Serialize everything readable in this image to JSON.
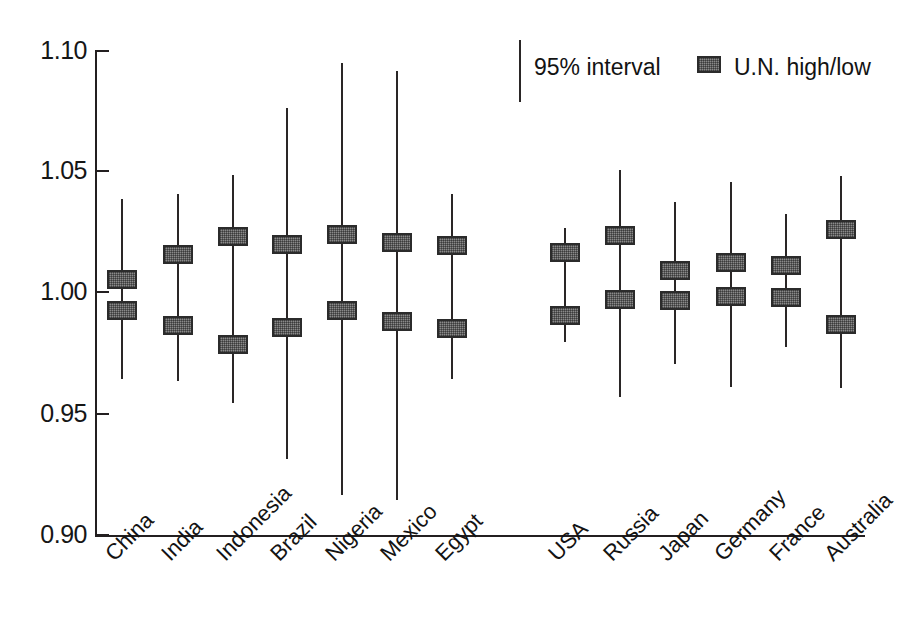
{
  "chart_data": {
    "type": "scatter",
    "title": "",
    "xlabel": "",
    "ylabel": "",
    "ylim": [
      0.9,
      1.1
    ],
    "yticks": [
      0.9,
      0.95,
      1.0,
      1.05,
      1.1
    ],
    "ytick_labels": [
      "0.90",
      "0.95",
      "1.00",
      "1.05",
      "1.10"
    ],
    "grid": false,
    "legend_position": "top-right",
    "legend": [
      {
        "label": "95% interval",
        "marker": "vertical-line"
      },
      {
        "label": "U.N. high/low",
        "marker": "gray-square"
      }
    ],
    "categories": [
      "China",
      "India",
      "Indonesia",
      "Brazil",
      "Nigeria",
      "Mexico",
      "Egypt",
      "USA",
      "Russia",
      "Japan",
      "Germany",
      "France",
      "Australia"
    ],
    "group_gap_after": "Egypt",
    "series": [
      {
        "name": "95% interval",
        "type": "interval",
        "lower": [
          0.9645,
          0.9635,
          0.9545,
          0.9315,
          0.9165,
          0.9145,
          0.9645,
          0.9795,
          0.957,
          0.9705,
          0.961,
          0.9775,
          0.9605
        ],
        "upper": [
          1.0385,
          1.0405,
          1.0485,
          1.076,
          1.0945,
          1.0915,
          1.0405,
          1.0265,
          1.0505,
          1.0375,
          1.0455,
          1.0325,
          1.048
        ]
      },
      {
        "name": "U.N. high",
        "type": "marker",
        "values": [
          1.0055,
          1.0155,
          1.023,
          1.02,
          1.024,
          1.0205,
          1.0195,
          1.0165,
          1.0235,
          1.009,
          1.0125,
          1.011,
          1.026
        ]
      },
      {
        "name": "U.N. low",
        "type": "marker",
        "values": [
          0.9925,
          0.9865,
          0.9785,
          0.9855,
          0.9925,
          0.988,
          0.985,
          0.9905,
          0.997,
          0.9965,
          0.9985,
          0.998,
          0.987
        ]
      }
    ]
  },
  "colors": {
    "axis": "#231f20",
    "line": "#2a2626",
    "marker_fill": "#8a8a8a",
    "marker_border": "#2b2b2b",
    "text": "#131313",
    "background": "#ffffff"
  }
}
